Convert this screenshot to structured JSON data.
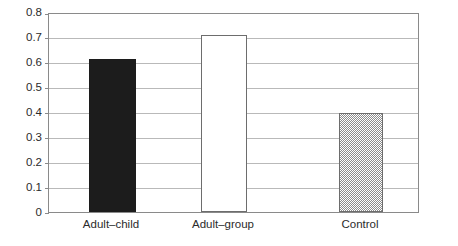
{
  "chart_data": {
    "type": "bar",
    "title": "",
    "subtitle": "",
    "xlabel": "",
    "ylabel": "",
    "categories": [
      "Adult–child",
      "Adult–group",
      "Control"
    ],
    "values": [
      0.62,
      0.715,
      0.4
    ],
    "series": [
      {
        "name": "",
        "values": [
          0.62,
          0.715,
          0.4
        ]
      }
    ],
    "ylim": [
      0,
      0.8
    ],
    "y_ticks": [
      "0",
      "0.1",
      "0.2",
      "0.3",
      "0.4",
      "0.5",
      "0.6",
      "0.7",
      "0.8"
    ],
    "y_tick_values": [
      0,
      0.1,
      0.2,
      0.3,
      0.4,
      0.5,
      0.6,
      0.7,
      0.8
    ],
    "grid": true,
    "grid_axis": "y",
    "legend": false,
    "legend_position": "none",
    "annotations": [],
    "bar_styles": [
      "solid-black",
      "white-outline",
      "gray-checker"
    ],
    "colors": {
      "bar_adult_child": "#1c1c1c",
      "bar_adult_group": "#ffffff",
      "bar_control": "#8c8c8c",
      "gridline": "#b9b9b9",
      "frame": "#8a8a8a",
      "text": "#2b2b2b",
      "background": "#ffffff"
    }
  }
}
